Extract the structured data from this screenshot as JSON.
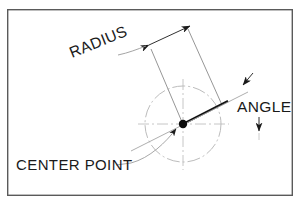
{
  "diagram": {
    "type": "technical-drawing",
    "background_color": "#ffffff",
    "border": {
      "color": "#5a5a5a",
      "x": 7,
      "y": 9,
      "width": 286,
      "height": 187,
      "stroke_width": 1.4
    },
    "labels": {
      "radius": "RADIUS",
      "angle": "ANGLE",
      "center_point": "CENTER POINT"
    },
    "geometry": {
      "center": {
        "x": 183,
        "y": 124
      },
      "circle_radius": 38,
      "circle_style": "dash-dot",
      "circle_color": "#b8b8b8",
      "centerline_color": "#c2c2c2",
      "radius_line_angle_deg": -27,
      "radius_label_rotation_deg": -22,
      "dimension_line_color": "#7d7d7d",
      "object_line_color": "#111111",
      "text_color": "#1a1a1a"
    }
  }
}
